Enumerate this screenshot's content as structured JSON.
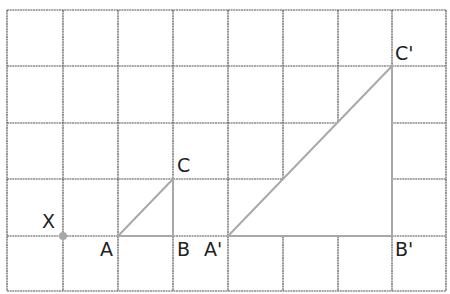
{
  "diagram": {
    "type": "grid-enlargement",
    "grid": {
      "cols": 8,
      "rows": 5,
      "x_lines": [
        7,
        63,
        118,
        173,
        228,
        283,
        338,
        392,
        446
      ],
      "y_lines": [
        10,
        66,
        123,
        179,
        236,
        291
      ],
      "line_color": "#555555"
    },
    "shape_color": "#a8a8a8",
    "center_of_enlargement": {
      "label": "X",
      "point": [
        63,
        236
      ],
      "label_pos": [
        42,
        228
      ]
    },
    "original_triangle": {
      "vertices": [
        {
          "label": "A",
          "point": [
            118,
            236
          ],
          "label_pos": [
            100,
            256
          ]
        },
        {
          "label": "B",
          "point": [
            173,
            236
          ],
          "label_pos": [
            177,
            256
          ]
        },
        {
          "label": "C",
          "point": [
            173,
            179
          ],
          "label_pos": [
            177,
            172
          ]
        }
      ]
    },
    "image_triangle": {
      "scale_factor": 3,
      "vertices": [
        {
          "label": "A'",
          "point": [
            228,
            236
          ],
          "label_pos": [
            204,
            256
          ]
        },
        {
          "label": "B'",
          "point": [
            392,
            236
          ],
          "label_pos": [
            395,
            256
          ]
        },
        {
          "label": "C'",
          "point": [
            392,
            66
          ],
          "label_pos": [
            395,
            60
          ]
        }
      ]
    }
  }
}
